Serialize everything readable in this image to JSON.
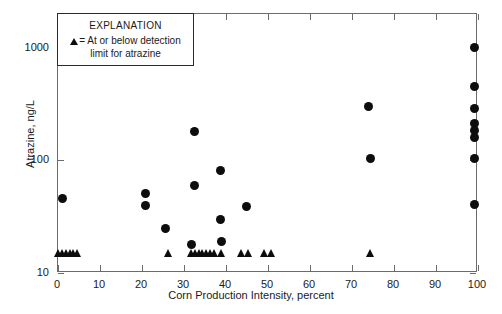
{
  "chart_data": {
    "type": "scatter",
    "title": "",
    "xlabel": "Corn Production Intensity, percent",
    "ylabel": "Atrazine, ng/L",
    "xlim": [
      0,
      100
    ],
    "ylim": [
      10,
      2000
    ],
    "yscale": "log",
    "xscale": "linear",
    "grid": false,
    "xticks": [
      0,
      10,
      20,
      30,
      40,
      50,
      60,
      70,
      80,
      90,
      100
    ],
    "xtick_labels": [
      "0",
      "10",
      "20",
      "30",
      "40",
      "50",
      "60",
      "70",
      "80",
      "90",
      "100"
    ],
    "yticks": [
      10,
      100,
      1000
    ],
    "ytick_labels": [
      "10",
      "100",
      "1000"
    ],
    "legend": {
      "position": "upper-left-inside",
      "title": "EXPLANATION",
      "entry_symbol": "triangle",
      "entry_line1": "= At or below detection",
      "entry_line2": "limit for atrazine"
    },
    "series": [
      {
        "name": "Detected atrazine",
        "marker": "circle",
        "color": "#0d0d0d",
        "points": [
          {
            "x": 1.0,
            "y": 46
          },
          {
            "x": 20.8,
            "y": 51
          },
          {
            "x": 20.8,
            "y": 40
          },
          {
            "x": 25.7,
            "y": 25
          },
          {
            "x": 32.4,
            "y": 180
          },
          {
            "x": 31.8,
            "y": 18
          },
          {
            "x": 32.6,
            "y": 60
          },
          {
            "x": 38.8,
            "y": 81
          },
          {
            "x": 38.8,
            "y": 30
          },
          {
            "x": 39.0,
            "y": 19
          },
          {
            "x": 44.8,
            "y": 39
          },
          {
            "x": 74.0,
            "y": 300
          },
          {
            "x": 74.4,
            "y": 105
          },
          {
            "x": 99.2,
            "y": 1000
          },
          {
            "x": 99.2,
            "y": 450
          },
          {
            "x": 99.2,
            "y": 290
          },
          {
            "x": 99.2,
            "y": 215
          },
          {
            "x": 99.2,
            "y": 185
          },
          {
            "x": 99.2,
            "y": 160
          },
          {
            "x": 99.2,
            "y": 105
          },
          {
            "x": 99.2,
            "y": 41
          }
        ]
      },
      {
        "name": "At or below detection limit for atrazine",
        "marker": "triangle",
        "color": "#0d0d0d",
        "points": [
          {
            "x": 0.2,
            "y": 15
          },
          {
            "x": 1.1,
            "y": 15
          },
          {
            "x": 2.0,
            "y": 15
          },
          {
            "x": 2.9,
            "y": 15
          },
          {
            "x": 3.8,
            "y": 15
          },
          {
            "x": 4.7,
            "y": 15
          },
          {
            "x": 26.2,
            "y": 15
          },
          {
            "x": 31.8,
            "y": 15
          },
          {
            "x": 32.7,
            "y": 15
          },
          {
            "x": 33.6,
            "y": 15
          },
          {
            "x": 34.5,
            "y": 15
          },
          {
            "x": 35.4,
            "y": 15
          },
          {
            "x": 36.3,
            "y": 15
          },
          {
            "x": 37.2,
            "y": 15
          },
          {
            "x": 39.0,
            "y": 15
          },
          {
            "x": 43.6,
            "y": 15
          },
          {
            "x": 45.3,
            "y": 15
          },
          {
            "x": 49.2,
            "y": 15
          },
          {
            "x": 50.9,
            "y": 15
          },
          {
            "x": 74.4,
            "y": 15
          }
        ]
      }
    ]
  }
}
